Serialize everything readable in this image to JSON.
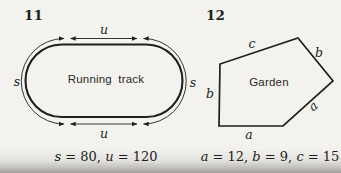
{
  "page": {
    "background_color": "#f3f2ef",
    "ink_color": "#211f1d"
  },
  "figure11": {
    "number": "11",
    "shape": "stadium-running-track",
    "shape_label": "Running track",
    "top_side_label": "u",
    "bottom_side_label": "u",
    "left_curve_label": "s",
    "right_curve_label": "s",
    "formula": {
      "var1": "s",
      "rest1": " = 80, ",
      "var2": "u",
      "rest2": " = 120"
    }
  },
  "figure12": {
    "number": "12",
    "shape": "pentagon-garden",
    "shape_label": "Garden",
    "side_label_c": "c",
    "side_label_b_top": "b",
    "side_label_a_right": "a",
    "side_label_a_bottom": "a",
    "side_label_b_left": "b",
    "formula": {
      "var1": "a",
      "rest1": " = 12, ",
      "var2": "b",
      "rest2": " = 9, ",
      "var3": "c",
      "rest3": " = 15"
    }
  }
}
